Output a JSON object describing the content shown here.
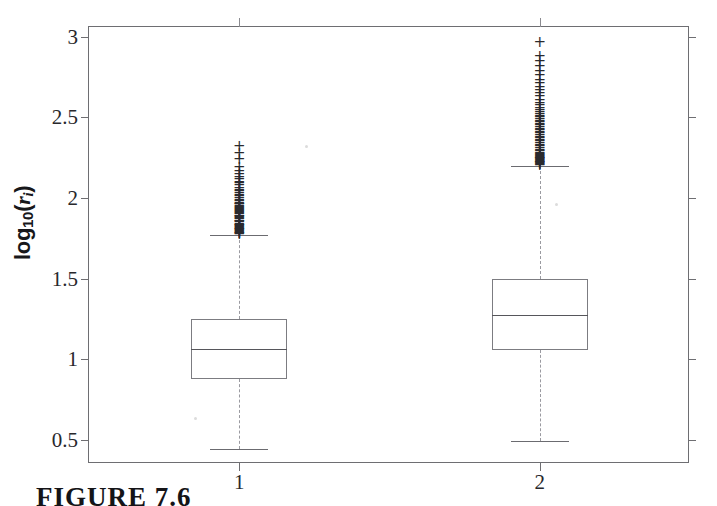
{
  "figure": {
    "caption": "FIGURE 7.6",
    "background_color": "#ffffff",
    "line_color": "#6e6e72"
  },
  "axes": {
    "y_title_main": "log",
    "y_title_sub": "10",
    "y_title_open_paren": "(",
    "y_title_var": "r",
    "y_title_var_sub": "i",
    "y_title_close_paren": ")",
    "y_title_plain": "log10(ri)",
    "x_title": ""
  },
  "chart_data": {
    "type": "box",
    "title": "",
    "xlabel": "",
    "ylabel": "log10(r_i)",
    "categories": [
      "1",
      "2"
    ],
    "x_tick_labels": [
      "1",
      "2"
    ],
    "y_tick_labels": [
      "0.5",
      "1",
      "1.5",
      "2",
      "2.5",
      "3"
    ],
    "y_ticks": [
      0.5,
      1,
      1.5,
      2,
      2.5,
      3
    ],
    "ylim": [
      0.35,
      3.06
    ],
    "xlim": [
      0.5,
      2.5
    ],
    "grid": false,
    "legend": false,
    "legend_position": "none",
    "boxes": [
      {
        "name": "1",
        "x": 1,
        "whisker_low": 0.445,
        "q1": 0.88,
        "median": 1.065,
        "q3": 1.25,
        "whisker_high": 1.77,
        "outliers": [
          1.775,
          1.78,
          1.785,
          1.79,
          1.795,
          1.8,
          1.805,
          1.81,
          1.815,
          1.82,
          1.825,
          1.83,
          1.835,
          1.84,
          1.85,
          1.855,
          1.86,
          1.87,
          1.875,
          1.88,
          1.885,
          1.89,
          1.9,
          1.905,
          1.91,
          1.92,
          1.925,
          1.93,
          1.94,
          1.945,
          1.95,
          1.96,
          1.965,
          1.97,
          1.98,
          1.99,
          2.0,
          2.01,
          2.02,
          2.03,
          2.04,
          2.05,
          2.06,
          2.08,
          2.09,
          2.1,
          2.12,
          2.13,
          2.15,
          2.17,
          2.19,
          2.24,
          2.28,
          2.32
        ],
        "outlier_marker": "+"
      },
      {
        "name": "2",
        "x": 2,
        "whisker_low": 0.49,
        "q1": 1.055,
        "median": 1.275,
        "q3": 1.5,
        "whisker_high": 2.2,
        "outliers": [
          2.205,
          2.21,
          2.215,
          2.22,
          2.225,
          2.23,
          2.235,
          2.24,
          2.245,
          2.25,
          2.255,
          2.26,
          2.265,
          2.27,
          2.28,
          2.29,
          2.3,
          2.31,
          2.32,
          2.33,
          2.34,
          2.35,
          2.36,
          2.37,
          2.38,
          2.39,
          2.4,
          2.41,
          2.42,
          2.43,
          2.44,
          2.45,
          2.46,
          2.47,
          2.48,
          2.49,
          2.5,
          2.51,
          2.52,
          2.53,
          2.545,
          2.56,
          2.575,
          2.59,
          2.61,
          2.63,
          2.65,
          2.67,
          2.69,
          2.71,
          2.73,
          2.76,
          2.79,
          2.82,
          2.85,
          2.88,
          2.97
        ],
        "outlier_marker": "+"
      }
    ]
  }
}
